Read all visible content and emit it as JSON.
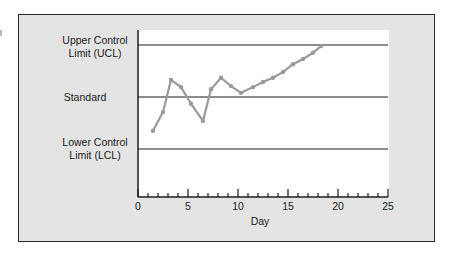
{
  "chart_data": {
    "type": "line",
    "title": "",
    "xlabel": "Day",
    "ylabel": "",
    "xlim": [
      0,
      25
    ],
    "x_ticks": [
      0,
      5,
      10,
      15,
      20,
      25
    ],
    "x_minor_tick_step": 1,
    "y_reference_lines": [
      {
        "label": "Upper Control Limit (UCL)",
        "value": 1
      },
      {
        "label": "Standard",
        "value": 0
      },
      {
        "label": "Lower Control Limit (LCL)",
        "value": -1
      }
    ],
    "series": [
      {
        "name": "Measurement",
        "color": "#9a9a9a",
        "x": [
          1.5,
          2.5,
          3.3,
          4.3,
          5.3,
          6.5,
          7.3,
          8.3,
          9.3,
          10.3,
          11.5,
          12.5,
          13.5,
          14.5,
          15.5,
          16.5,
          17.5,
          18.3
        ],
        "values": [
          -0.65,
          -0.29,
          0.33,
          0.19,
          -0.13,
          -0.46,
          0.15,
          0.37,
          0.21,
          0.08,
          0.19,
          0.29,
          0.37,
          0.48,
          0.63,
          0.73,
          0.85,
          0.98
        ]
      }
    ],
    "grid": false,
    "legend": null
  },
  "labels": {
    "ucl_line1": "Upper Control",
    "ucl_line2": "Limit (UCL)",
    "standard": "Standard",
    "lcl_line1": "Lower Control",
    "lcl_line2": "Limit (LCL)",
    "x_axis_title": "Day",
    "ticks": [
      "0",
      "5",
      "10",
      "15",
      "20",
      "25"
    ]
  },
  "colors": {
    "frame_bg": "#e4e4e4",
    "plot_bg": "#ffffff",
    "line_color": "#9a9a9a",
    "axis_color": "#1a1a1a"
  }
}
